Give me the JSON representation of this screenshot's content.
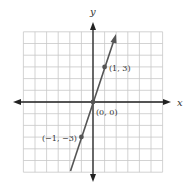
{
  "chart_data": {
    "type": "line",
    "title": "",
    "xlabel": "x",
    "ylabel": "y",
    "xlim": [
      -6,
      6
    ],
    "ylim": [
      -6,
      6
    ],
    "grid": true,
    "series": [
      {
        "name": "y = 3x",
        "x": [
          -2,
          2
        ],
        "y": [
          -6,
          6
        ],
        "points": [
          {
            "x": -1,
            "y": -3,
            "label": "(−1, −3)"
          },
          {
            "x": 0,
            "y": 0,
            "label": "(0, 0)"
          },
          {
            "x": 1,
            "y": 3,
            "label": "(1, 3)"
          }
        ]
      }
    ],
    "colors": {
      "grid": "#c8c8c8",
      "axis": "#222222",
      "line": "#555555",
      "point": "#555555"
    }
  },
  "labels": {
    "x_axis": "x",
    "y_axis": "y",
    "p1": "(1, 3)",
    "p0": "(0, 0)",
    "pm1": "(−1, −3)"
  }
}
